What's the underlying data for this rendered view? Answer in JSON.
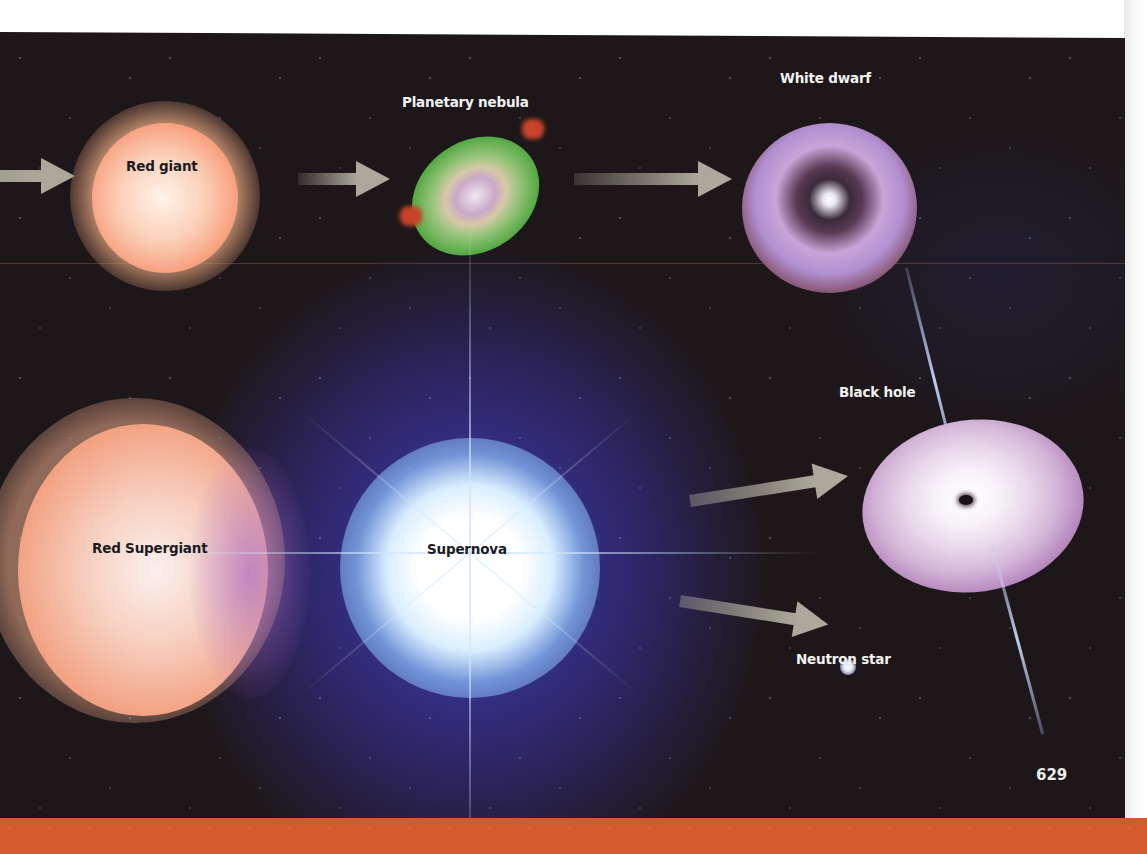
{
  "diagram": {
    "stages": [
      {
        "id": "red-giant",
        "label": "Red giant"
      },
      {
        "id": "planetary-nebula",
        "label": "Planetary nebula"
      },
      {
        "id": "white-dwarf",
        "label": "White dwarf"
      },
      {
        "id": "red-supergiant",
        "label": "Red Supergiant"
      },
      {
        "id": "supernova",
        "label": "Supernova"
      },
      {
        "id": "black-hole",
        "label": "Black hole"
      },
      {
        "id": "neutron-star",
        "label": "Neutron star"
      }
    ],
    "flows": [
      {
        "from": "previous-stage",
        "to": "red-giant"
      },
      {
        "from": "red-giant",
        "to": "planetary-nebula"
      },
      {
        "from": "planetary-nebula",
        "to": "white-dwarf"
      },
      {
        "from": "red-supergiant",
        "to": "supernova"
      },
      {
        "from": "supernova",
        "to": "black-hole"
      },
      {
        "from": "supernova",
        "to": "neutron-star"
      }
    ]
  },
  "page": {
    "number": "629"
  },
  "colors": {
    "background_space": "#1d1719",
    "red_giant": "#f6906c",
    "nebula_green": "#4fa63e",
    "white_dwarf_purple": "#b28fcf",
    "supernova_blue": "#5a6ad0",
    "black_hole_disk": "#d4b6d8",
    "arrow_gray": "#aca99c",
    "bottom_band_orange": "#d45a2c"
  }
}
